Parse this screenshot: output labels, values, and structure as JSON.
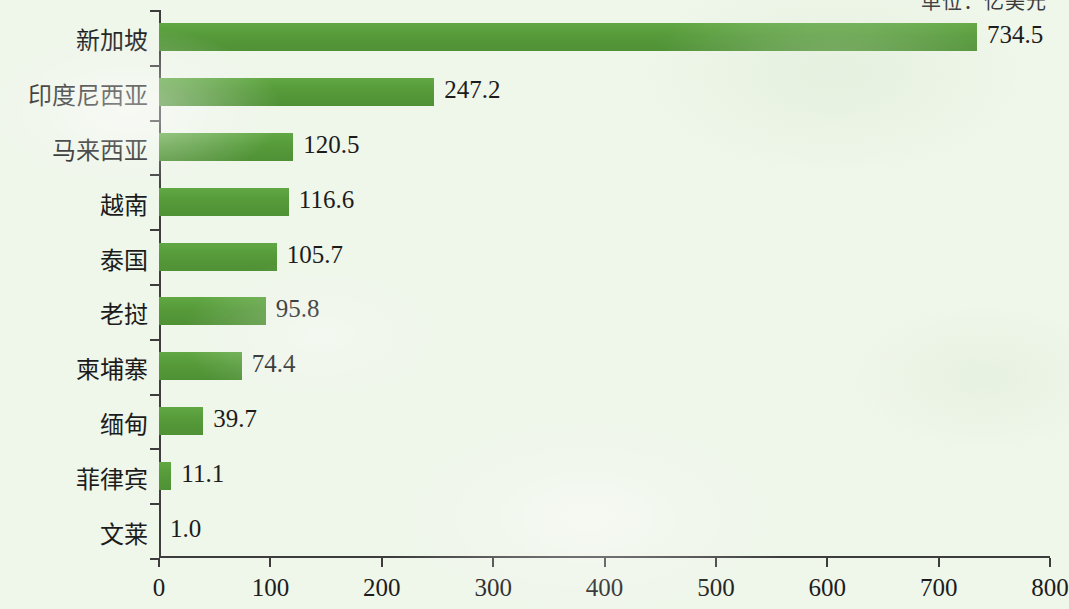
{
  "unit_caption": "单位：亿美元",
  "chart_data": {
    "type": "bar",
    "orientation": "horizontal",
    "title": "",
    "subtitle": "",
    "unit_label": "单位：亿美元",
    "xlabel": "",
    "ylabel": "",
    "xlim": [
      0,
      800
    ],
    "x_ticks": [
      0,
      100,
      200,
      300,
      400,
      500,
      600,
      700,
      800
    ],
    "x_tick_labels": [
      "0",
      "100",
      "200",
      "300",
      "400",
      "500",
      "600",
      "700",
      "800"
    ],
    "grid": false,
    "legend": false,
    "bar_color": "#589e3c",
    "background_color": "#eff6ea",
    "categories": [
      "新加坡",
      "印度尼西亚",
      "马来西亚",
      "越南",
      "泰国",
      "老挝",
      "柬埔寨",
      "缅甸",
      "菲律宾",
      "文莱"
    ],
    "values": [
      734.5,
      247.2,
      120.5,
      116.6,
      105.7,
      95.8,
      74.4,
      39.7,
      11.1,
      1.0
    ],
    "value_labels": [
      "734.5",
      "247.2",
      "120.5",
      "116.6",
      "105.7",
      "95.8",
      "74.4",
      "39.7",
      "11.1",
      "1.0"
    ]
  }
}
